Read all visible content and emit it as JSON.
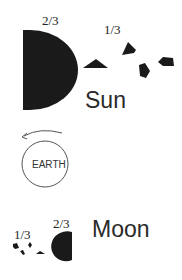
{
  "diagram": {
    "sun": {
      "label": "Sun",
      "main_fraction_label": "2/3",
      "fragments_fraction_label": "1/3"
    },
    "earth": {
      "label": "EARTH"
    },
    "moon": {
      "label": "Moon",
      "main_fraction_label": "2/3",
      "fragments_fraction_label": "1/3"
    },
    "colors": {
      "fill": "#1a1a1a",
      "stroke": "#555555",
      "background": "#ffffff"
    }
  }
}
